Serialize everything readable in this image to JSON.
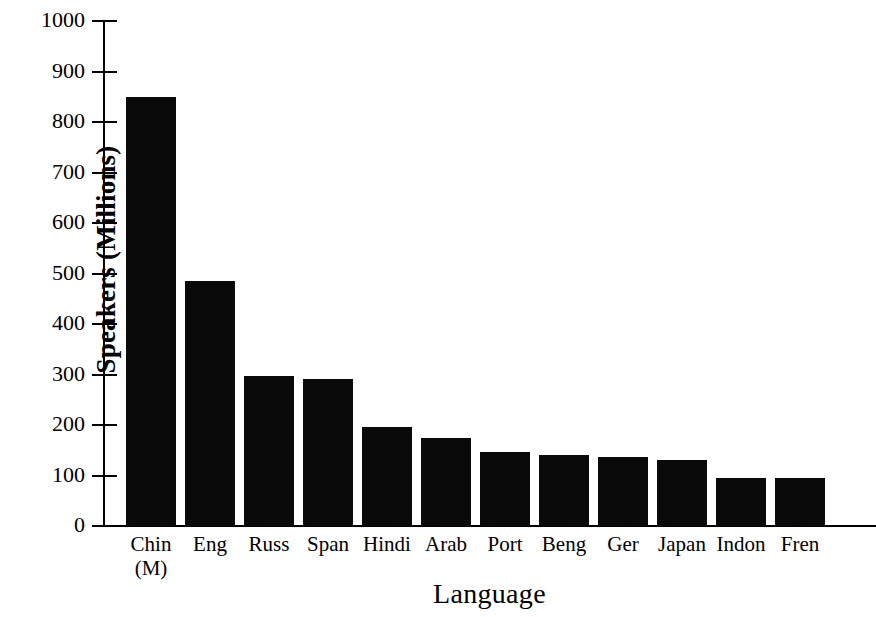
{
  "chart_data": {
    "type": "bar",
    "title": "",
    "xlabel": "Language",
    "ylabel": "Speakers (Millions)",
    "categories": [
      "Chin (M)",
      "Eng",
      "Russ",
      "Span",
      "Hindi",
      "Arab",
      "Port",
      "Beng",
      "Ger",
      "Japan",
      "Indon",
      "Fren"
    ],
    "category_lines": [
      [
        "Chin",
        "(M)"
      ],
      [
        "Eng",
        ""
      ],
      [
        "Russ",
        ""
      ],
      [
        "Span",
        ""
      ],
      [
        "Hindi",
        ""
      ],
      [
        "Arab",
        ""
      ],
      [
        "Port",
        ""
      ],
      [
        "Beng",
        ""
      ],
      [
        "Ger",
        ""
      ],
      [
        "Japan",
        ""
      ],
      [
        "Indon",
        ""
      ],
      [
        "Fren",
        ""
      ]
    ],
    "values": [
      850,
      485,
      298,
      292,
      197,
      175,
      147,
      141,
      137,
      131,
      96,
      95
    ],
    "ylim": [
      0,
      1000
    ],
    "yticks": [
      0,
      100,
      200,
      300,
      400,
      500,
      600,
      700,
      800,
      900,
      1000
    ],
    "ytick_labels": [
      "0",
      "100",
      "200",
      "300",
      "400",
      "500",
      "600",
      "700",
      "800",
      "900",
      "1000"
    ],
    "grid": false,
    "legend": false,
    "bar_color": "#0a0a0a",
    "axis_color": "#000000",
    "background_color": "#ffffff"
  }
}
